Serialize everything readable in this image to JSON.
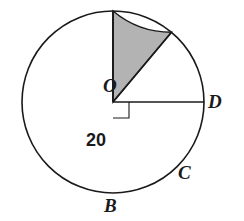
{
  "figure": {
    "kind": "circle-sector-geometry-diagram",
    "width": 244,
    "height": 221,
    "background_color": "#ffffff",
    "stroke_color": "#1a1a1a",
    "shaded_fill_color": "#b3b3b3",
    "circle": {
      "center_x": 113,
      "center_y": 102,
      "radius": 91,
      "stroke_width": 1.6
    },
    "points": {
      "O": {
        "x": 113,
        "y": 102,
        "role": "center"
      },
      "B": {
        "x": 113,
        "y": 193,
        "role": "on-circle",
        "angle_deg": 270
      },
      "C": {
        "x": 172,
        "y": 172,
        "role": "on-circle",
        "angle_deg": 310
      },
      "D": {
        "x": 204,
        "y": 102,
        "role": "on-circle",
        "angle_deg": 0
      }
    },
    "segments": [
      {
        "name": "OB",
        "from": "O",
        "to": "B"
      },
      {
        "name": "OC",
        "from": "O",
        "to": "C"
      },
      {
        "name": "OD",
        "from": "O",
        "to": "D"
      }
    ],
    "arcs": [
      {
        "name": "arc-BC",
        "from": "B",
        "to": "C"
      }
    ],
    "shaded_region": {
      "name": "sector-BOC",
      "vertices": [
        "O",
        "B",
        "C"
      ],
      "arc": "arc-BC",
      "angle_deg": 40
    },
    "right_angle_marker": {
      "at": "O",
      "between": [
        "OB",
        "OD"
      ],
      "size": 16,
      "angle_deg": 90
    }
  },
  "labels": {
    "O": "O",
    "B": "B",
    "C": "C",
    "D": "D",
    "radius": "20"
  }
}
